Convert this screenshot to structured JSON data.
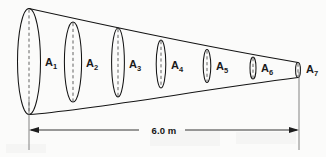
{
  "figure": {
    "background_color": "#fbfbfa",
    "line_color": "#141414",
    "dash_color": "#5c5c5c"
  },
  "dimension": {
    "label": "6.0 m",
    "value": 6.0,
    "unit": "m",
    "left_arrow": "arrow-left",
    "right_arrow": "arrow-right"
  },
  "cross_sections": [
    {
      "id": "A1",
      "label": "A",
      "subscript": "1",
      "cx": 29,
      "cy": 61.5,
      "rx": 11.5,
      "ry": 53.0,
      "label_x": 45,
      "label_y": 66
    },
    {
      "id": "A2",
      "label": "A",
      "subscript": "2",
      "cx": 73,
      "cy": 62.0,
      "rx": 8.6,
      "ry": 40.0,
      "label_x": 86,
      "label_y": 67
    },
    {
      "id": "A3",
      "label": "A",
      "subscript": "3",
      "cx": 118,
      "cy": 62.5,
      "rx": 6.4,
      "ry": 34.5,
      "label_x": 129,
      "label_y": 68
    },
    {
      "id": "A4",
      "label": "A",
      "subscript": "4",
      "cx": 161,
      "cy": 64.0,
      "rx": 4.8,
      "ry": 24.0,
      "label_x": 171,
      "label_y": 69
    },
    {
      "id": "A5",
      "label": "A",
      "subscript": "5",
      "cx": 207,
      "cy": 66.0,
      "rx": 3.8,
      "ry": 16.5,
      "label_x": 216,
      "label_y": 70
    },
    {
      "id": "A6",
      "label": "A",
      "subscript": "6",
      "cx": 253,
      "cy": 68.0,
      "rx": 3.0,
      "ry": 11.0,
      "label_x": 261,
      "label_y": 72
    },
    {
      "id": "A7",
      "label": "A",
      "subscript": "7",
      "cx": 298,
      "cy": 70.0,
      "rx": 2.4,
      "ry": 7.5,
      "label_x": 306,
      "label_y": 73
    }
  ]
}
